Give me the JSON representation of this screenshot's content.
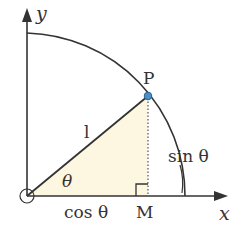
{
  "diagram": {
    "type": "unit-circle-trig",
    "labels": {
      "y_axis": "y",
      "x_axis": "x",
      "point_p": "P",
      "point_m": "M",
      "hypotenuse": "l",
      "angle": "θ",
      "adjacent": "cos θ",
      "opposite": "sin θ"
    },
    "colors": {
      "stroke": "#333333",
      "fill_triangle": "#fdf6e0",
      "point_p": "#4a90c8"
    }
  }
}
